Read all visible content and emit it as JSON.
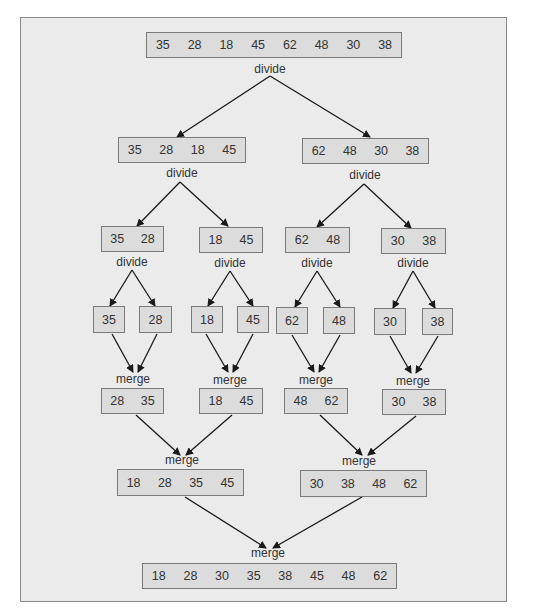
{
  "labels": {
    "divide": "divide",
    "merge": "merge"
  },
  "tree": {
    "input": [
      35,
      28,
      18,
      45,
      62,
      48,
      30,
      38
    ],
    "divide1": [
      [
        35,
        28,
        18,
        45
      ],
      [
        62,
        48,
        30,
        38
      ]
    ],
    "divide2": [
      [
        35,
        28
      ],
      [
        18,
        45
      ],
      [
        62,
        48
      ],
      [
        30,
        38
      ]
    ],
    "singles": [
      [
        35
      ],
      [
        28
      ],
      [
        18
      ],
      [
        45
      ],
      [
        62
      ],
      [
        48
      ],
      [
        30
      ],
      [
        38
      ]
    ],
    "merge1": [
      [
        28,
        35
      ],
      [
        18,
        45
      ],
      [
        48,
        62
      ],
      [
        30,
        38
      ]
    ],
    "merge2": [
      [
        18,
        28,
        35,
        45
      ],
      [
        30,
        38,
        48,
        62
      ]
    ],
    "output": [
      18,
      28,
      30,
      35,
      38,
      45,
      48,
      62
    ]
  },
  "colors": {
    "frame_bg": "#ebebeb",
    "box_fill": "#dcdcdc",
    "box_border": "#7a7a7a",
    "arrow": "#1a1a1a"
  }
}
